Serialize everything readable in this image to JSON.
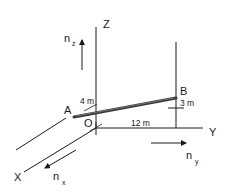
{
  "diagram": {
    "axes": {
      "x_label": "X",
      "y_label": "Y",
      "z_label": "Z",
      "origin_label": "O"
    },
    "points": {
      "a_label": "A",
      "b_label": "B"
    },
    "dimensions": {
      "dim_4": "4 m",
      "dim_3": "3 m",
      "dim_12": "12 m"
    },
    "unit_vectors": {
      "nz_main": "n",
      "nz_sub": "z",
      "ny_main": "n",
      "ny_sub": "y",
      "nx_main": "n",
      "nx_sub": "x"
    },
    "colors": {
      "line": "#1a1a1a",
      "bar": "#3a3a3a",
      "background": "#ffffff"
    }
  }
}
